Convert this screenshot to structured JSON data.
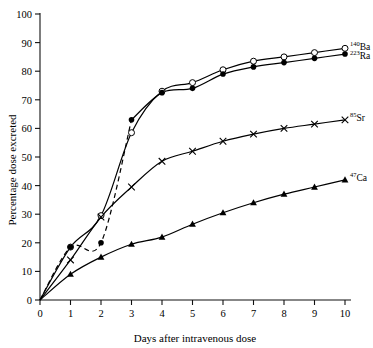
{
  "chart_data": {
    "type": "line",
    "title": "",
    "xlabel": "Days after intravenous dose",
    "ylabel": "Percentage dose excreted",
    "xlim": [
      0,
      10
    ],
    "ylim": [
      0,
      100
    ],
    "xticks": [
      "0",
      "1",
      "2",
      "3",
      "4",
      "5",
      "6",
      "7",
      "8",
      "9",
      "10"
    ],
    "yticks": [
      "0",
      "10",
      "20",
      "30",
      "40",
      "50",
      "60",
      "70",
      "80",
      "90",
      "100"
    ],
    "grid": false,
    "legend_position": "right-inline-end-of-curve",
    "series": [
      {
        "name": "140Ba",
        "label_sup": "140",
        "label_base": "Ba",
        "marker": "open-circle",
        "line": "solid",
        "x": [
          0,
          1,
          2,
          3,
          4,
          5,
          6,
          7,
          8,
          9,
          10
        ],
        "values": [
          0,
          18.5,
          29.5,
          58.5,
          73,
          76,
          80.5,
          83.5,
          85,
          86.5,
          88
        ],
        "marker_x": [
          1,
          2,
          3,
          4,
          5,
          6,
          7,
          8,
          9,
          10
        ],
        "marker_values": [
          18.5,
          29.5,
          58.5,
          73,
          76,
          80.5,
          83.5,
          85,
          86.5,
          88
        ]
      },
      {
        "name": "223Ra",
        "label_sup": "223",
        "label_base": "Ra",
        "marker": "filled-circle",
        "line": "dashed-then-solid",
        "x": [
          0,
          1,
          2,
          3,
          4,
          5,
          6,
          7,
          8,
          9,
          10
        ],
        "values": [
          0,
          18.5,
          20,
          63,
          72.5,
          74,
          79,
          81.5,
          83,
          84.5,
          86
        ],
        "marker_x": [
          1,
          2,
          3,
          4,
          5,
          6,
          7,
          8,
          9,
          10
        ],
        "marker_values": [
          18.5,
          20,
          63,
          72.5,
          74,
          79,
          81.5,
          83,
          84.5,
          86
        ]
      },
      {
        "name": "85Sr",
        "label_sup": "85",
        "label_base": "Sr",
        "marker": "cross",
        "line": "solid",
        "x": [
          0,
          1,
          2,
          3,
          4,
          5,
          6,
          7,
          8,
          9,
          10
        ],
        "values": [
          0,
          14,
          29,
          39.5,
          48.5,
          52,
          55.5,
          58,
          60,
          61.5,
          63
        ],
        "marker_x": [
          1,
          2,
          3,
          4,
          5,
          6,
          7,
          8,
          9,
          10
        ],
        "marker_values": [
          14,
          29,
          39.5,
          48.5,
          52,
          55.5,
          58,
          60,
          61.5,
          63
        ]
      },
      {
        "name": "47Ca",
        "label_sup": "47",
        "label_base": "Ca",
        "marker": "filled-triangle",
        "line": "solid",
        "x": [
          0,
          1,
          2,
          3,
          4,
          5,
          6,
          7,
          8,
          9,
          10
        ],
        "values": [
          0,
          9,
          15,
          19.5,
          22,
          26.5,
          30.5,
          34,
          37,
          39.5,
          42
        ],
        "marker_x": [
          1,
          2,
          3,
          4,
          5,
          6,
          7,
          8,
          9,
          10
        ],
        "marker_values": [
          9,
          15,
          19.5,
          22,
          26.5,
          30.5,
          34,
          37,
          39.5,
          42
        ]
      }
    ],
    "colors": {
      "axis": "#111111",
      "line": "#000000",
      "marker": "#000000",
      "background": "#ffffff"
    }
  }
}
